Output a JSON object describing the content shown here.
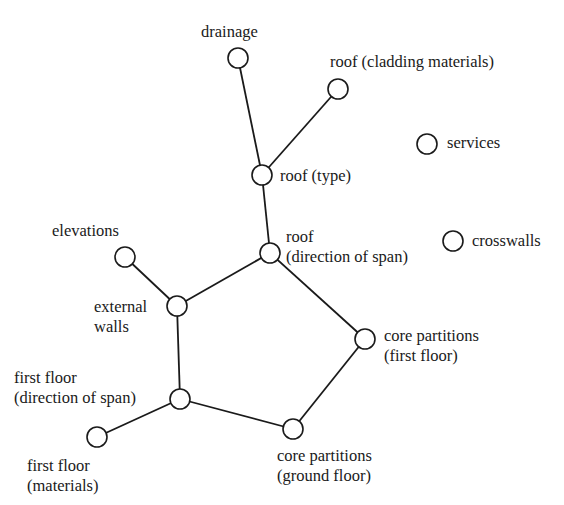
{
  "diagram": {
    "type": "network",
    "nodes": [
      {
        "id": "drainage",
        "label": "drainage",
        "x": 238,
        "y": 58
      },
      {
        "id": "roof_cladding",
        "label": "roof (cladding materials)",
        "x": 338,
        "y": 89
      },
      {
        "id": "services",
        "label": "services",
        "x": 427,
        "y": 144
      },
      {
        "id": "roof_type",
        "label": "roof (type)",
        "x": 262,
        "y": 175
      },
      {
        "id": "roof_span",
        "label_line1": "roof",
        "label_line2": "(direction of span)",
        "x": 270,
        "y": 253
      },
      {
        "id": "crosswalls",
        "label": "crosswalls",
        "x": 453,
        "y": 241
      },
      {
        "id": "elevations",
        "label": "elevations",
        "x": 125,
        "y": 257
      },
      {
        "id": "external_walls",
        "label_line1": "external",
        "label_line2": "walls",
        "x": 177,
        "y": 306
      },
      {
        "id": "core_first",
        "label_line1": "core partitions",
        "label_line2": "(first floor)",
        "x": 365,
        "y": 339
      },
      {
        "id": "first_floor_span",
        "label_line1": "first floor",
        "label_line2": "(direction of span)",
        "x": 180,
        "y": 399
      },
      {
        "id": "first_floor_materials",
        "label_line1": "first floor",
        "label_line2": "(materials)",
        "x": 97,
        "y": 437
      },
      {
        "id": "core_ground",
        "label_line1": "core partitions",
        "label_line2": "(ground floor)",
        "x": 293,
        "y": 429
      }
    ],
    "edges": [
      [
        "drainage",
        "roof_type"
      ],
      [
        "roof_cladding",
        "roof_type"
      ],
      [
        "roof_type",
        "roof_span"
      ],
      [
        "roof_span",
        "external_walls"
      ],
      [
        "roof_span",
        "core_first"
      ],
      [
        "elevations",
        "external_walls"
      ],
      [
        "external_walls",
        "first_floor_span"
      ],
      [
        "first_floor_span",
        "first_floor_materials"
      ],
      [
        "first_floor_span",
        "core_ground"
      ],
      [
        "core_ground",
        "core_first"
      ]
    ],
    "node_radius": 10,
    "stroke": "#1a1a1a"
  }
}
